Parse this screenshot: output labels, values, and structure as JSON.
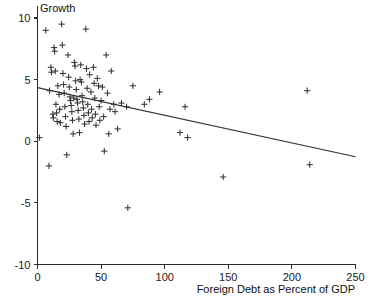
{
  "chart_data": {
    "type": "scatter",
    "title": "",
    "ylabel": "Growth",
    "xlabel": "Foreign Debt as Percent of GDP",
    "xlim": [
      0,
      250
    ],
    "ylim": [
      -10,
      10
    ],
    "xticks": [
      0,
      50,
      100,
      150,
      200,
      250
    ],
    "xtick_labels": [
      "0",
      "50",
      "100",
      "150",
      "200",
      "250"
    ],
    "yticks": [
      -10,
      -5,
      0,
      5,
      10
    ],
    "ytick_labels": [
      "-10",
      "-5",
      "0",
      "5",
      "10"
    ],
    "grid": false,
    "legend": false,
    "marker": "plus",
    "series": [
      {
        "name": "countries",
        "points": [
          [
            1.5,
            0.3
          ],
          [
            6.5,
            9.0
          ],
          [
            9.5,
            4.1
          ],
          [
            9.0,
            -2.0
          ],
          [
            10.5,
            6.0
          ],
          [
            11.0,
            5.6
          ],
          [
            12.0,
            2.2
          ],
          [
            12.5,
            1.9
          ],
          [
            13.0,
            7.6
          ],
          [
            13.5,
            7.3
          ],
          [
            14.0,
            5.7
          ],
          [
            14.5,
            3.0
          ],
          [
            15.0,
            2.3
          ],
          [
            15.5,
            1.6
          ],
          [
            16.0,
            4.5
          ],
          [
            17.0,
            3.8
          ],
          [
            17.5,
            2.6
          ],
          [
            18.0,
            1.5
          ],
          [
            19.0,
            9.5
          ],
          [
            19.5,
            7.8
          ],
          [
            20.0,
            5.5
          ],
          [
            20.5,
            4.6
          ],
          [
            21.0,
            3.9
          ],
          [
            21.5,
            2.8
          ],
          [
            22.0,
            2.0
          ],
          [
            22.5,
            1.2
          ],
          [
            23.0,
            -1.1
          ],
          [
            24.0,
            7.0
          ],
          [
            24.5,
            5.2
          ],
          [
            25.0,
            4.4
          ],
          [
            25.5,
            3.6
          ],
          [
            26.0,
            3.3
          ],
          [
            26.5,
            2.9
          ],
          [
            27.0,
            2.4
          ],
          [
            27.5,
            1.7
          ],
          [
            28.0,
            0.6
          ],
          [
            28.5,
            3.5
          ],
          [
            29.0,
            6.4
          ],
          [
            29.5,
            6.1
          ],
          [
            30.0,
            4.9
          ],
          [
            30.5,
            4.2
          ],
          [
            31.0,
            3.4
          ],
          [
            31.5,
            3.1
          ],
          [
            32.0,
            2.5
          ],
          [
            32.5,
            1.8
          ],
          [
            33.0,
            0.7
          ],
          [
            33.5,
            5.0
          ],
          [
            34.0,
            6.2
          ],
          [
            34.5,
            4.8
          ],
          [
            35.0,
            3.7
          ],
          [
            35.5,
            3.2
          ],
          [
            36.0,
            2.7
          ],
          [
            36.5,
            2.1
          ],
          [
            37.0,
            1.4
          ],
          [
            38.0,
            9.1
          ],
          [
            38.5,
            5.9
          ],
          [
            39.0,
            4.3
          ],
          [
            39.5,
            3.0
          ],
          [
            40.0,
            2.3
          ],
          [
            40.5,
            1.6
          ],
          [
            41.0,
            5.4
          ],
          [
            42.0,
            4.0
          ],
          [
            42.5,
            2.6
          ],
          [
            43.0,
            1.9
          ],
          [
            44.0,
            6.0
          ],
          [
            44.5,
            4.7
          ],
          [
            45.0,
            3.5
          ],
          [
            45.5,
            2.2
          ],
          [
            46.0,
            1.3
          ],
          [
            47.0,
            5.1
          ],
          [
            48.0,
            4.5
          ],
          [
            48.5,
            2.8
          ],
          [
            49.0,
            1.7
          ],
          [
            50.0,
            3.3
          ],
          [
            51.0,
            4.4
          ],
          [
            52.0,
            2.0
          ],
          [
            52.5,
            -0.8
          ],
          [
            54.0,
            7.0
          ],
          [
            55.0,
            3.9
          ],
          [
            56.0,
            0.6
          ],
          [
            57.0,
            2.6
          ],
          [
            58.0,
            5.7
          ],
          [
            60.0,
            3.0
          ],
          [
            61.0,
            2.4
          ],
          [
            63.0,
            1.0
          ],
          [
            66.0,
            3.1
          ],
          [
            70.0,
            2.8
          ],
          [
            71.0,
            -5.4
          ],
          [
            75.0,
            4.5
          ],
          [
            84.0,
            3.0
          ],
          [
            88.0,
            3.4
          ],
          [
            96.0,
            4.0
          ],
          [
            112.0,
            0.7
          ],
          [
            116.0,
            2.8
          ],
          [
            118.0,
            0.3
          ],
          [
            146.0,
            -2.9
          ],
          [
            212.0,
            4.1
          ],
          [
            214.0,
            -1.9
          ]
        ]
      }
    ],
    "trend_line": {
      "name": "fitted-regression-line",
      "x_start": 0,
      "y_start": 4.35,
      "x_end": 250,
      "y_end": -1.25
    }
  }
}
